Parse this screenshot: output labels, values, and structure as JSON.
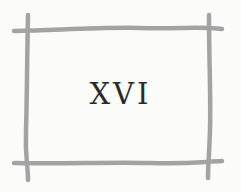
{
  "card": {
    "numeral": "XVI",
    "frame_color": "#a3a3a3",
    "text_color": "#2a2a2a",
    "background": "#fbfbfa"
  }
}
